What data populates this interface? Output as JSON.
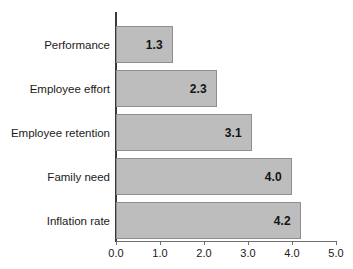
{
  "chart_data": {
    "type": "bar",
    "orientation": "horizontal",
    "title": "",
    "xlabel": "",
    "ylabel": "",
    "categories": [
      "Performance",
      "Employee effort",
      "Employee retention",
      "Family need",
      "Inflation rate"
    ],
    "values": [
      1.3,
      2.3,
      3.1,
      4.0,
      4.2
    ],
    "value_labels": [
      "1.3",
      "2.3",
      "3.1",
      "4.0",
      "4.2"
    ],
    "xlim": [
      0.0,
      5.0
    ],
    "xticks": [
      0.0,
      1.0,
      2.0,
      3.0,
      4.0,
      5.0
    ],
    "xtick_labels": [
      "0.0",
      "1.0",
      "2.0",
      "3.0",
      "4.0",
      "5.0"
    ],
    "grid": false,
    "legend": null,
    "bar_fill_color": "#bdbdbd",
    "bar_border_color": "#8e8e8e",
    "axis_color": "#3a3a3a",
    "background_color": "#ffffff",
    "data_label_position": "inside-end"
  },
  "bars": [
    {
      "label": "Performance",
      "value": 1.3,
      "value_label": "1.3"
    },
    {
      "label": "Employee effort",
      "value": 2.3,
      "value_label": "2.3"
    },
    {
      "label": "Employee retention",
      "value": 3.1,
      "value_label": "3.1"
    },
    {
      "label": "Family need",
      "value": 4.0,
      "value_label": "4.0"
    },
    {
      "label": "Inflation rate",
      "value": 4.2,
      "value_label": "4.2"
    }
  ],
  "axis": {
    "ticks": [
      {
        "value": 0.0,
        "label": "0.0"
      },
      {
        "value": 1.0,
        "label": "1.0"
      },
      {
        "value": 2.0,
        "label": "2.0"
      },
      {
        "value": 3.0,
        "label": "3.0"
      },
      {
        "value": 4.0,
        "label": "4.0"
      },
      {
        "value": 5.0,
        "label": "5.0"
      }
    ]
  }
}
